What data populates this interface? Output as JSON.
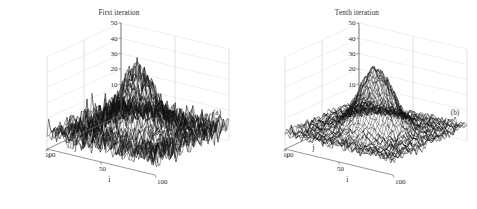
{
  "figure": {
    "background": "#ffffff",
    "panel_count": 2
  },
  "panels": [
    {
      "title": "First iteration",
      "tag": "(a)",
      "axis_labels": {
        "x": "i",
        "y": "j",
        "z": ""
      },
      "z_ticks": [
        "50",
        "40",
        "30",
        "20",
        "10",
        "0",
        "-10"
      ],
      "i_ticks": [
        "1",
        "50",
        "100"
      ],
      "j_ticks": [
        "100",
        "50",
        "1"
      ]
    },
    {
      "title": "Tenth iteration",
      "tag": "(b)",
      "axis_labels": {
        "x": "i",
        "y": "j",
        "z": ""
      },
      "z_ticks": [
        "50",
        "40",
        "30",
        "20",
        "10",
        "0",
        "-10"
      ],
      "i_ticks": [
        "1",
        "50",
        "100"
      ],
      "j_ticks": [
        "100",
        "50",
        "1"
      ]
    }
  ],
  "chart_data": [
    {
      "type": "line",
      "render": "surface-mesh-3d",
      "title": "First iteration",
      "annotation": "(a)",
      "xlabel": "i",
      "ylabel": "j",
      "zlabel": "",
      "xlim": [
        1,
        100
      ],
      "ylim": [
        1,
        100
      ],
      "zlim": [
        -10,
        50
      ],
      "xticks": [
        1,
        50,
        100
      ],
      "yticks": [
        1,
        50,
        100
      ],
      "zticks": [
        -10,
        0,
        10,
        20,
        30,
        40,
        50
      ],
      "grid": true,
      "legend": null,
      "surface": {
        "model": "gaussian-peak-plus-noise",
        "peak_amplitude": 40,
        "peak_center_i": 50,
        "peak_center_j": 50,
        "peak_sigma": 13,
        "baseline": 0,
        "noise_amplitude": 6,
        "noise_character": "high spiky noise across the floor"
      }
    },
    {
      "type": "line",
      "render": "surface-mesh-3d",
      "title": "Tenth iteration",
      "annotation": "(b)",
      "xlabel": "i",
      "ylabel": "j",
      "zlabel": "",
      "xlim": [
        1,
        100
      ],
      "ylim": [
        1,
        100
      ],
      "zlim": [
        -10,
        50
      ],
      "xticks": [
        1,
        50,
        100
      ],
      "yticks": [
        1,
        50,
        100
      ],
      "zticks": [
        -10,
        0,
        10,
        20,
        30,
        40,
        50
      ],
      "grid": true,
      "legend": null,
      "surface": {
        "model": "gaussian-peak-plus-noise",
        "peak_amplitude": 40,
        "peak_center_i": 50,
        "peak_center_j": 50,
        "peak_sigma": 13,
        "baseline": 0,
        "noise_amplitude": 2.5,
        "noise_character": "reduced, smoother floor after ten iterations"
      }
    }
  ]
}
